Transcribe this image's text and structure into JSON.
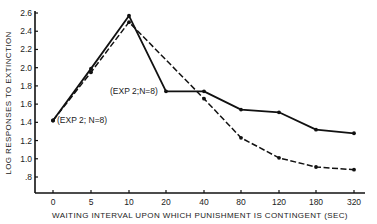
{
  "chart_data": {
    "type": "line",
    "title": "",
    "xlabel": "WAITING INTERVAL UPON WHICH PUNISHMENT IS CONTINGENT (SEC)",
    "ylabel": "LOG RESPONSES TO EXTINCTION",
    "categories": [
      "0",
      "5",
      "10",
      "20",
      "40",
      "80",
      "120",
      "180",
      "320"
    ],
    "yticks": [
      "2.6",
      "2.4",
      "2.2",
      "2.0",
      "1.8",
      "1.6",
      "1.4",
      "1.2",
      "1.0",
      ".8"
    ],
    "ylim": [
      0.6,
      2.6
    ],
    "grid": false,
    "legend_position": "inline annotations",
    "series": [
      {
        "name": "(EXP 2; N=8)",
        "style": "solid",
        "values": [
          1.42,
          1.99,
          2.57,
          1.74,
          1.74,
          1.54,
          1.51,
          1.32,
          1.28
        ]
      },
      {
        "name": "(EXP 2;N=8)",
        "style": "dashed",
        "values": [
          1.42,
          1.95,
          2.5,
          null,
          1.66,
          1.23,
          1.01,
          0.91,
          0.88
        ]
      }
    ],
    "annotations": [
      {
        "text": "(EXP 2; N=8)",
        "near": "x=0, solid series start"
      },
      {
        "text": "(EXP 2;N=8)",
        "near": "x=20, solid series"
      }
    ]
  },
  "labels": {
    "annot_solid": "(EXP 2; N=8)",
    "annot_dashed": "(EXP 2;N=8)"
  }
}
